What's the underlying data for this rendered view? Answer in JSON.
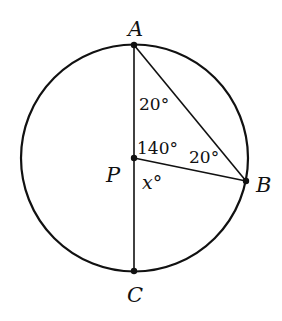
{
  "diagram": {
    "type": "circle-geometry",
    "colors": {
      "stroke": "#111111",
      "background": "#ffffff"
    },
    "circle": {
      "center": "P",
      "cx": 134,
      "cy": 158,
      "r": 113
    },
    "points": {
      "A": {
        "label": "A",
        "x": 134,
        "y": 45
      },
      "P": {
        "label": "P",
        "x": 134,
        "y": 158
      },
      "B": {
        "label": "B",
        "x": 246,
        "y": 181
      },
      "C": {
        "label": "C",
        "x": 134,
        "y": 271
      }
    },
    "segments": [
      {
        "from": "A",
        "to": "C",
        "name": "diameter-AC"
      },
      {
        "from": "A",
        "to": "B",
        "name": "chord-AB"
      },
      {
        "from": "P",
        "to": "B",
        "name": "radius-PB"
      }
    ],
    "angles": {
      "angle_PAB": {
        "label": "20°",
        "at": "A"
      },
      "angle_APB": {
        "label": "140°",
        "at": "P"
      },
      "angle_PBA": {
        "label": "20°",
        "at": "B"
      },
      "angle_BPC": {
        "label": "x°",
        "at": "P"
      }
    }
  }
}
